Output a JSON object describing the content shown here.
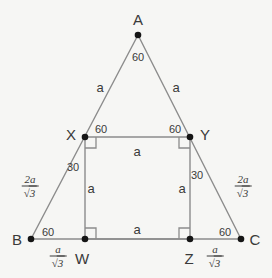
{
  "figure": {
    "background_color": "#f6f6f4",
    "line_color": "#8c8c8c",
    "point_color": "#151515",
    "text_color": "#3a3a3a",
    "width": 272,
    "height": 278
  },
  "points": [
    {
      "id": "A",
      "label": "A",
      "x": 138,
      "y": 35,
      "label_x": 138,
      "label_y": 19
    },
    {
      "id": "B",
      "label": "B",
      "x": 31,
      "y": 239,
      "label_x": 17,
      "label_y": 239
    },
    {
      "id": "C",
      "label": "C",
      "x": 241,
      "y": 239,
      "label_x": 255,
      "label_y": 239
    },
    {
      "id": "X",
      "label": "X",
      "x": 85,
      "y": 137,
      "label_x": 71,
      "label_y": 134
    },
    {
      "id": "Y",
      "label": "Y",
      "x": 190,
      "y": 137,
      "label_x": 205,
      "label_y": 134
    },
    {
      "id": "W",
      "label": "W",
      "x": 85,
      "y": 239,
      "label_x": 82,
      "label_y": 258
    },
    {
      "id": "Z",
      "label": "Z",
      "x": 190,
      "y": 239,
      "label_x": 189,
      "label_y": 258
    }
  ],
  "segments": [
    {
      "name": "side-AB",
      "from": "A",
      "to": "B"
    },
    {
      "name": "side-AC",
      "from": "A",
      "to": "C"
    },
    {
      "name": "side-BC",
      "from": "B",
      "to": "C"
    },
    {
      "name": "square-top-XY",
      "from": "X",
      "to": "Y"
    },
    {
      "name": "square-left-XW",
      "from": "X",
      "to": "W"
    },
    {
      "name": "square-right-YZ",
      "from": "Y",
      "to": "Z"
    },
    {
      "name": "square-bottom-WZ",
      "from": "W",
      "to": "Z"
    }
  ],
  "angle_labels": [
    {
      "name": "angle-at-A",
      "value": "60",
      "x": 138,
      "y": 57
    },
    {
      "name": "angle-at-B",
      "value": "60",
      "x": 48,
      "y": 232
    },
    {
      "name": "angle-at-C",
      "value": "60",
      "x": 225,
      "y": 232
    },
    {
      "name": "angle-at-X-upper",
      "value": "60",
      "x": 101,
      "y": 129
    },
    {
      "name": "angle-at-Y-upper",
      "value": "60",
      "x": 175,
      "y": 129
    },
    {
      "name": "angle-at-X-lower",
      "value": "30",
      "x": 73,
      "y": 167
    },
    {
      "name": "angle-at-Y-lower",
      "value": "30",
      "x": 197,
      "y": 175
    }
  ],
  "length_labels": [
    {
      "name": "length-AX",
      "value": "a",
      "x": 100,
      "y": 87
    },
    {
      "name": "length-AY",
      "value": "a",
      "x": 176,
      "y": 87
    },
    {
      "name": "length-XY",
      "value": "a",
      "x": 137,
      "y": 151
    },
    {
      "name": "length-XW",
      "value": "a",
      "x": 91,
      "y": 188
    },
    {
      "name": "length-YZ",
      "value": "a",
      "x": 182,
      "y": 188
    },
    {
      "name": "length-WZ",
      "value": "a",
      "x": 137,
      "y": 229
    }
  ],
  "fraction_labels": [
    {
      "name": "length-BX-fraction",
      "numerator": "2a",
      "denominator_radicand": "3",
      "x": 30,
      "y": 186
    },
    {
      "name": "length-CY-fraction",
      "numerator": "2a",
      "denominator_radicand": "3",
      "x": 243,
      "y": 186
    },
    {
      "name": "length-BW-fraction",
      "numerator": "a",
      "denominator_radicand": "3",
      "x": 58,
      "y": 256
    },
    {
      "name": "length-ZC-fraction",
      "numerator": "a",
      "denominator_radicand": "3",
      "x": 215,
      "y": 256
    }
  ],
  "right_angle_markers": [
    {
      "name": "right-angle-at-X",
      "x": 85,
      "y": 137,
      "dx": 1,
      "dy": 1
    },
    {
      "name": "right-angle-at-Y",
      "x": 190,
      "y": 137,
      "dx": -1,
      "dy": 1
    },
    {
      "name": "right-angle-at-W",
      "x": 85,
      "y": 239,
      "dx": 1,
      "dy": -1
    },
    {
      "name": "right-angle-at-Z",
      "x": 190,
      "y": 239,
      "dx": -1,
      "dy": -1
    }
  ],
  "radical_symbol": "√"
}
